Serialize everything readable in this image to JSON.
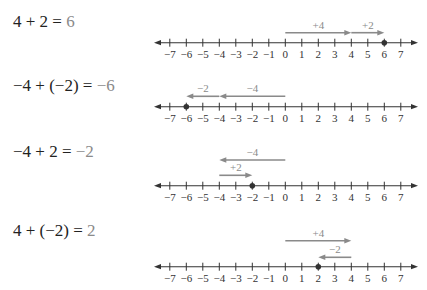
{
  "colors": {
    "axis": "#333333",
    "arrow": "#8a8a8a",
    "result_text": "#8a8a8a",
    "equation_text": "#222222",
    "dot": "#333333"
  },
  "axis": {
    "min": -7,
    "max": 7,
    "tick_labels": [
      "−7",
      "−6",
      "−5",
      "−4",
      "−3",
      "−2",
      "−1",
      "0",
      "1",
      "2",
      "3",
      "4",
      "5",
      "6",
      "7"
    ],
    "x_zero": 285.3,
    "unit_px": 16.5,
    "left_end": 154,
    "right_end": 418
  },
  "rows": [
    {
      "equation": {
        "lhs": "4 + 2 = ",
        "result": "6",
        "y": 13
      },
      "axis_y": 42.7,
      "dot_at": 6,
      "arrows": [
        {
          "from": 0,
          "to": 4,
          "label": "+4",
          "y": 32.7
        },
        {
          "from": 4,
          "to": 6,
          "label": "+2",
          "y": 32.7
        }
      ]
    },
    {
      "equation": {
        "lhs": "−4 + (−2) = ",
        "result": "−6",
        "y": 77
      },
      "axis_y": 106.7,
      "dot_at": -6,
      "arrows": [
        {
          "from": 0,
          "to": -4,
          "label": "−4",
          "y": 96.3
        },
        {
          "from": -4,
          "to": -6,
          "label": "−2",
          "y": 96.3
        }
      ]
    },
    {
      "equation": {
        "lhs": "−4 + 2 = ",
        "result": "−2",
        "y": 143
      },
      "axis_y": 185.7,
      "dot_at": -2,
      "arrows": [
        {
          "from": 0,
          "to": -4,
          "label": "−4",
          "y": 160
        },
        {
          "from": -4,
          "to": -2,
          "label": "+2",
          "y": 175.3
        }
      ]
    },
    {
      "equation": {
        "lhs": "4 + (−2) = ",
        "result": "2",
        "y": 222
      },
      "axis_y": 266.7,
      "dot_at": 2,
      "arrows": [
        {
          "from": 0,
          "to": 4,
          "label": "+4",
          "y": 240.7
        },
        {
          "from": 4,
          "to": 2,
          "label": "−2",
          "y": 257.3
        }
      ]
    }
  ]
}
